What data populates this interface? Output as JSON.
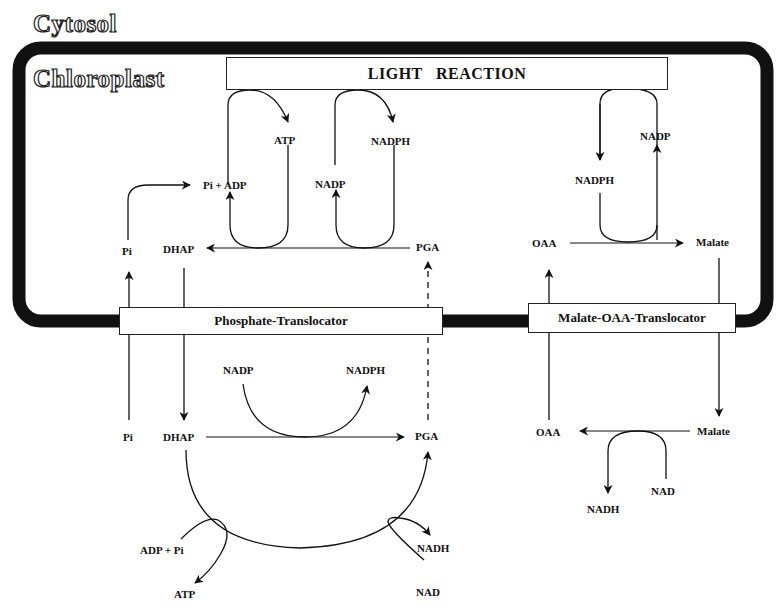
{
  "regions": {
    "cytosol": "Cytosol",
    "chloroplast": "Chloroplast"
  },
  "boxes": {
    "light_reaction": "LIGHT   REACTION",
    "phosphate_translocator": "Phosphate-Translocator",
    "malate_oaa_translocator": "Malate-OAA-Translocator"
  },
  "chloroplast_labels": {
    "atp": "ATP",
    "nadph_top": "NADPH",
    "pi_adp": "Pi + ADP",
    "nadp_left": "NADP",
    "pi": "Pi",
    "dhap": "DHAP",
    "pga": "PGA",
    "nadp_right": "NADP",
    "nadph_right": "NADPH",
    "oaa": "OAA",
    "malate": "Malate"
  },
  "cytosol_labels": {
    "nadp": "NADP",
    "nadph": "NADPH",
    "pi": "Pi",
    "dhap": "DHAP",
    "pga": "PGA",
    "adp_pi": "ADP + Pi",
    "atp": "ATP",
    "nadh_left_cycle": "NADH",
    "nad_left_cycle": "NAD",
    "oaa": "OAA",
    "malate": "Malate",
    "nadh": "NADH",
    "nad": "NAD"
  },
  "colors": {
    "ink": "#111111",
    "membrane": "#111111",
    "background": "#ffffff"
  }
}
